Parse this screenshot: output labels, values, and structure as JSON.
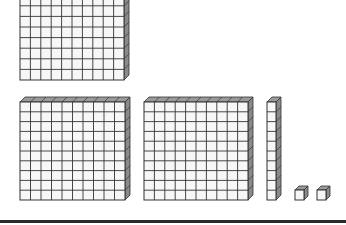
{
  "diagram": {
    "colors": {
      "front_face": "#f7f7f7",
      "grid_line": "#333333",
      "top_face": "#9a9a9a",
      "side_face": "#8a8a8a",
      "rule": "#2a2a2a"
    },
    "blocks": [
      {
        "type": "flat",
        "value": 100,
        "cols": 10,
        "rows": 10,
        "x": 20,
        "y": -26,
        "w": 104,
        "h": 106,
        "depth": 5,
        "label": "hundred-flat-top"
      },
      {
        "type": "flat",
        "value": 100,
        "cols": 10,
        "rows": 10,
        "x": 20,
        "y": 102,
        "w": 105,
        "h": 98,
        "depth": 5,
        "label": "hundred-flat-bottom-left"
      },
      {
        "type": "flat",
        "value": 100,
        "cols": 10,
        "rows": 10,
        "x": 144,
        "y": 102,
        "w": 104,
        "h": 98,
        "depth": 5,
        "label": "hundred-flat-bottom-middle"
      },
      {
        "type": "rod",
        "value": 10,
        "cols": 1,
        "rows": 10,
        "x": 267,
        "y": 102,
        "w": 9,
        "h": 98,
        "depth": 5,
        "label": "ten-rod"
      },
      {
        "type": "unit",
        "value": 1,
        "cols": 1,
        "rows": 1,
        "x": 295,
        "y": 190,
        "w": 9,
        "h": 10,
        "depth": 4,
        "label": "unit-cube-1"
      },
      {
        "type": "unit",
        "value": 1,
        "cols": 1,
        "rows": 1,
        "x": 317,
        "y": 190,
        "w": 9,
        "h": 10,
        "depth": 4,
        "label": "unit-cube-2"
      }
    ],
    "rule": {
      "y": 220
    }
  }
}
